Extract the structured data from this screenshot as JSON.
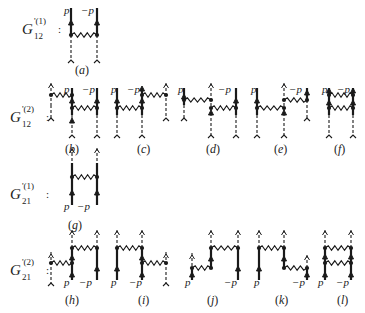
{
  "rows": [
    {
      "id": "g12-1",
      "symbol": "G",
      "sup": "'(1)",
      "sub": "12",
      "x": 22,
      "y": 21
    },
    {
      "id": "g12-2",
      "symbol": "G",
      "sup": "'(2)",
      "sub": "12",
      "x": 10,
      "y": 109
    },
    {
      "id": "g21-1",
      "symbol": "G",
      "sup": "'(1)",
      "sub": "21",
      "x": 10,
      "y": 186
    },
    {
      "id": "g21-2",
      "symbol": "G",
      "sup": "'(2)",
      "sub": "21",
      "x": 10,
      "y": 262
    }
  ],
  "captions": [
    {
      "label": "(a)",
      "x": 75,
      "y": 63
    },
    {
      "label": "(b)",
      "x": 65,
      "y": 142
    },
    {
      "label": "(c)",
      "x": 137,
      "y": 142
    },
    {
      "label": "(d)",
      "x": 206,
      "y": 142
    },
    {
      "label": "(e)",
      "x": 274,
      "y": 142
    },
    {
      "label": "(f)",
      "x": 334,
      "y": 142
    },
    {
      "label": "(g)",
      "x": 68,
      "y": 218
    },
    {
      "label": "(h)",
      "x": 65,
      "y": 293
    },
    {
      "label": "(i)",
      "x": 138,
      "y": 293
    },
    {
      "label": "(j)",
      "x": 207,
      "y": 293
    },
    {
      "label": "(k)",
      "x": 275,
      "y": 293
    },
    {
      "label": "(l)",
      "x": 337,
      "y": 293
    }
  ],
  "momenta": [
    {
      "text": "p",
      "x": 64,
      "y": 4
    },
    {
      "text": "−p",
      "x": 81,
      "y": 4
    },
    {
      "text": "p",
      "x": 64,
      "y": 83
    },
    {
      "text": "−p",
      "x": 82,
      "y": 83
    },
    {
      "text": "p",
      "x": 111,
      "y": 83
    },
    {
      "text": "−p",
      "x": 127,
      "y": 83
    },
    {
      "text": "p",
      "x": 178,
      "y": 83
    },
    {
      "text": "−p",
      "x": 218,
      "y": 83
    },
    {
      "text": "p",
      "x": 251,
      "y": 83
    },
    {
      "text": "−p",
      "x": 289,
      "y": 83
    },
    {
      "text": "p",
      "x": 322,
      "y": 83
    },
    {
      "text": "−p",
      "x": 337,
      "y": 83
    },
    {
      "text": "p",
      "x": 64,
      "y": 200
    },
    {
      "text": "−p",
      "x": 77,
      "y": 200
    },
    {
      "text": "p",
      "x": 64,
      "y": 276
    },
    {
      "text": "−p",
      "x": 79,
      "y": 276
    },
    {
      "text": "p",
      "x": 111,
      "y": 276
    },
    {
      "text": "−p",
      "x": 129,
      "y": 276
    },
    {
      "text": "p",
      "x": 185,
      "y": 276
    },
    {
      "text": "−p",
      "x": 224,
      "y": 276
    },
    {
      "text": "p",
      "x": 254,
      "y": 276
    },
    {
      "text": "−p",
      "x": 292,
      "y": 276
    },
    {
      "text": "p",
      "x": 318,
      "y": 276
    },
    {
      "text": "−p",
      "x": 336,
      "y": 276
    }
  ],
  "diagrams": {
    "solid": [
      [
        71,
        8,
        71,
        35
      ],
      [
        97,
        8,
        97,
        35
      ],
      [
        72,
        88,
        72,
        115
      ],
      [
        97,
        88,
        97,
        115
      ],
      [
        117,
        88,
        117,
        115
      ],
      [
        142,
        88,
        142,
        115
      ],
      [
        184,
        88,
        184,
        105
      ],
      [
        236,
        88,
        236,
        115
      ],
      [
        257,
        88,
        257,
        115
      ],
      [
        307,
        88,
        307,
        100
      ],
      [
        329,
        88,
        329,
        115
      ],
      [
        353,
        88,
        353,
        115
      ],
      [
        72,
        163,
        72,
        205
      ],
      [
        97,
        163,
        97,
        205
      ],
      [
        72,
        248,
        72,
        280
      ],
      [
        97,
        248,
        97,
        280
      ],
      [
        117,
        248,
        117,
        280
      ],
      [
        142,
        248,
        142,
        280
      ],
      [
        192,
        268,
        192,
        280
      ],
      [
        211,
        248,
        211,
        268
      ],
      [
        238,
        248,
        238,
        280
      ],
      [
        259,
        248,
        259,
        280
      ],
      [
        284,
        248,
        284,
        268
      ],
      [
        307,
        268,
        307,
        280
      ],
      [
        325,
        248,
        325,
        280
      ],
      [
        351,
        248,
        351,
        280
      ]
    ],
    "dashed": [
      [
        71,
        35,
        71,
        60
      ],
      [
        97,
        35,
        97,
        60
      ],
      [
        51,
        83,
        51,
        105
      ],
      [
        51,
        105,
        51,
        118
      ],
      [
        72,
        115,
        72,
        135
      ],
      [
        97,
        115,
        97,
        135
      ],
      [
        117,
        115,
        117,
        135
      ],
      [
        142,
        115,
        142,
        135
      ],
      [
        166,
        83,
        166,
        118
      ],
      [
        184,
        105,
        184,
        118
      ],
      [
        211,
        83,
        211,
        135
      ],
      [
        236,
        115,
        236,
        135
      ],
      [
        257,
        115,
        257,
        135
      ],
      [
        284,
        83,
        284,
        135
      ],
      [
        307,
        100,
        307,
        118
      ],
      [
        329,
        115,
        329,
        135
      ],
      [
        353,
        115,
        353,
        135
      ],
      [
        72,
        148,
        72,
        163
      ],
      [
        97,
        148,
        97,
        163
      ],
      [
        51,
        252,
        51,
        283
      ],
      [
        72,
        230,
        72,
        248
      ],
      [
        97,
        230,
        97,
        248
      ],
      [
        117,
        230,
        117,
        248
      ],
      [
        142,
        230,
        142,
        248
      ],
      [
        166,
        252,
        166,
        283
      ],
      [
        192,
        253,
        192,
        268
      ],
      [
        211,
        230,
        211,
        248
      ],
      [
        238,
        230,
        238,
        248
      ],
      [
        259,
        230,
        259,
        248
      ],
      [
        284,
        230,
        284,
        248
      ],
      [
        307,
        255,
        307,
        268
      ],
      [
        325,
        230,
        325,
        248
      ],
      [
        351,
        230,
        351,
        248
      ]
    ],
    "wiggly": [
      [
        71,
        35,
        97,
        35
      ],
      [
        51,
        95,
        72,
        95
      ],
      [
        72,
        108,
        97,
        108
      ],
      [
        117,
        108,
        142,
        108
      ],
      [
        142,
        95,
        166,
        95
      ],
      [
        184,
        100,
        211,
        100
      ],
      [
        211,
        108,
        236,
        108
      ],
      [
        257,
        108,
        284,
        108
      ],
      [
        284,
        100,
        307,
        100
      ],
      [
        329,
        95,
        353,
        95
      ],
      [
        329,
        108,
        353,
        108
      ],
      [
        72,
        177,
        97,
        177
      ],
      [
        51,
        263,
        72,
        263
      ],
      [
        72,
        248,
        97,
        248
      ],
      [
        117,
        248,
        142,
        248
      ],
      [
        142,
        263,
        166,
        263
      ],
      [
        192,
        268,
        211,
        268
      ],
      [
        211,
        248,
        238,
        248
      ],
      [
        259,
        248,
        284,
        248
      ],
      [
        284,
        268,
        307,
        268
      ],
      [
        325,
        248,
        351,
        248
      ],
      [
        325,
        263,
        351,
        263
      ]
    ],
    "dots": [
      [
        71,
        35
      ],
      [
        97,
        35
      ],
      [
        51,
        95
      ],
      [
        72,
        95
      ],
      [
        72,
        108
      ],
      [
        97,
        108
      ],
      [
        117,
        108
      ],
      [
        142,
        108
      ],
      [
        142,
        95
      ],
      [
        166,
        95
      ],
      [
        184,
        100
      ],
      [
        211,
        100
      ],
      [
        211,
        108
      ],
      [
        236,
        108
      ],
      [
        257,
        108
      ],
      [
        284,
        108
      ],
      [
        284,
        100
      ],
      [
        307,
        100
      ],
      [
        329,
        95
      ],
      [
        353,
        95
      ],
      [
        329,
        108
      ],
      [
        353,
        108
      ],
      [
        72,
        177
      ],
      [
        97,
        177
      ],
      [
        51,
        263
      ],
      [
        72,
        263
      ],
      [
        72,
        248
      ],
      [
        97,
        248
      ],
      [
        117,
        248
      ],
      [
        142,
        248
      ],
      [
        142,
        263
      ],
      [
        166,
        263
      ],
      [
        192,
        268
      ],
      [
        211,
        268
      ],
      [
        211,
        248
      ],
      [
        238,
        248
      ],
      [
        259,
        248
      ],
      [
        284,
        248
      ],
      [
        284,
        268
      ],
      [
        307,
        268
      ],
      [
        325,
        248
      ],
      [
        351,
        248
      ],
      [
        325,
        263
      ],
      [
        351,
        263
      ]
    ],
    "arrows_up_solid": [
      [
        71,
        22
      ],
      [
        97,
        22
      ],
      [
        72,
        100
      ],
      [
        72,
        120
      ],
      [
        97,
        100
      ],
      [
        117,
        100
      ],
      [
        142,
        100
      ],
      [
        142,
        88
      ],
      [
        184,
        96
      ],
      [
        211,
        112
      ],
      [
        236,
        100
      ],
      [
        257,
        100
      ],
      [
        284,
        112
      ],
      [
        307,
        92
      ],
      [
        329,
        90
      ],
      [
        329,
        102
      ],
      [
        353,
        90
      ],
      [
        353,
        102
      ],
      [
        72,
        192
      ],
      [
        97,
        192
      ],
      [
        72,
        257
      ],
      [
        72,
        274
      ],
      [
        97,
        268
      ],
      [
        117,
        268
      ],
      [
        142,
        257
      ],
      [
        142,
        274
      ],
      [
        192,
        274
      ],
      [
        211,
        258
      ],
      [
        238,
        268
      ],
      [
        259,
        268
      ],
      [
        284,
        258
      ],
      [
        307,
        274
      ],
      [
        325,
        256
      ],
      [
        325,
        274
      ],
      [
        351,
        256
      ],
      [
        351,
        274
      ]
    ],
    "arrows_up_dashed": [
      [
        51,
        85
      ],
      [
        166,
        85
      ],
      [
        211,
        85
      ],
      [
        284,
        85
      ],
      [
        72,
        150
      ],
      [
        97,
        150
      ],
      [
        51,
        255
      ],
      [
        166,
        255
      ],
      [
        192,
        256
      ],
      [
        307,
        257
      ],
      [
        72,
        232
      ],
      [
        97,
        232
      ],
      [
        117,
        232
      ],
      [
        142,
        232
      ],
      [
        211,
        232
      ],
      [
        238,
        232
      ],
      [
        259,
        232
      ],
      [
        284,
        232
      ],
      [
        325,
        232
      ],
      [
        351,
        232
      ]
    ],
    "forks": [
      [
        71,
        60
      ],
      [
        97,
        60
      ],
      [
        51,
        118
      ],
      [
        72,
        135
      ],
      [
        97,
        135
      ],
      [
        117,
        135
      ],
      [
        142,
        135
      ],
      [
        166,
        118
      ],
      [
        184,
        118
      ],
      [
        211,
        135
      ],
      [
        236,
        135
      ],
      [
        257,
        135
      ],
      [
        284,
        135
      ],
      [
        307,
        118
      ],
      [
        329,
        135
      ],
      [
        353,
        135
      ],
      [
        51,
        283
      ],
      [
        166,
        283
      ]
    ]
  }
}
